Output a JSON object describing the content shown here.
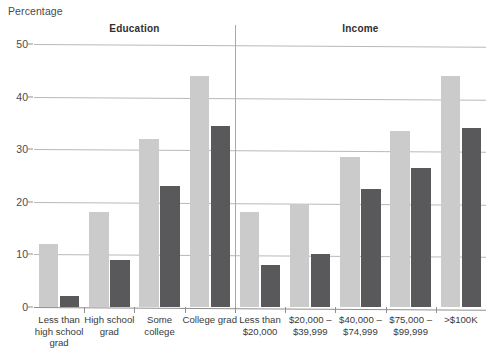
{
  "axis": {
    "y_title": "Percentage",
    "ticks": [
      0,
      10,
      20,
      30,
      40,
      50
    ]
  },
  "panels": [
    {
      "title": "Education"
    },
    {
      "title": "Income"
    }
  ],
  "chart_data": {
    "type": "bar",
    "title": "",
    "xlabel": "",
    "ylabel": "Percentage",
    "ylim": [
      0,
      50
    ],
    "grid": true,
    "legend": "none",
    "panels": [
      "Education",
      "Income"
    ],
    "categories": [
      "Less than\nhigh school\ngrad",
      "High school\ngrad",
      "Some college",
      "College grad",
      "Less than\n$20,000",
      "$20,000 –\n$39,999",
      "$40,000 –\n$74,999",
      "$75,000 –\n$99,999",
      ">$100K"
    ],
    "category_panel": [
      "Education",
      "Education",
      "Education",
      "Education",
      "Income",
      "Income",
      "Income",
      "Income",
      "Income"
    ],
    "series": [
      {
        "name": "light",
        "color": "#cbcbcb",
        "values": [
          12,
          18,
          32,
          44,
          18,
          19.5,
          28.5,
          33.5,
          44
        ]
      },
      {
        "name": "dark",
        "color": "#59595b",
        "values": [
          2,
          9,
          23,
          34.5,
          8,
          10,
          22.5,
          26.5,
          34
        ]
      }
    ]
  },
  "colors": {
    "light_bar": "#cbcbcb",
    "dark_bar": "#59595b",
    "gridline": "#b9b9b9",
    "axis": "#8f8f8f",
    "text": "#3a3a3a"
  }
}
